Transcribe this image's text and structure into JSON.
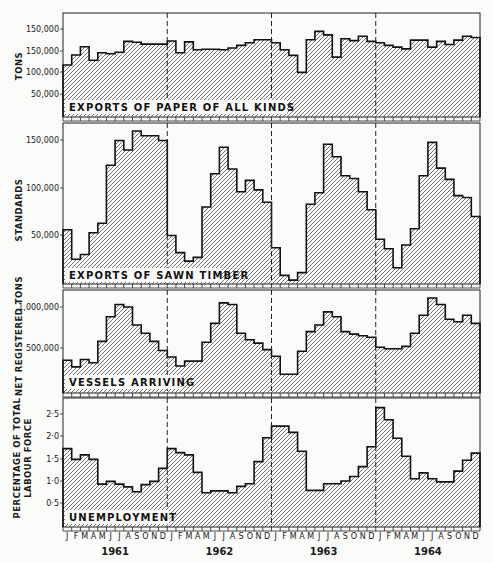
{
  "chart_data": [
    {
      "type": "area",
      "style": "step, hatched fill",
      "title": "EXPORTS OF PAPER OF ALL KINDS",
      "ylabel": "TONS",
      "yticks": [
        "150,000",
        "150,000",
        "100,000",
        "50,000"
      ],
      "ytick_values": [
        200000,
        150000,
        100000,
        50000
      ],
      "ylim": [
        0,
        220000
      ],
      "x_period": "monthly, Jan 1961 - Dec 1964",
      "values": [
        117000,
        140000,
        159000,
        128000,
        145000,
        143000,
        146000,
        171000,
        169000,
        165000,
        165000,
        165000,
        172000,
        145000,
        170000,
        152000,
        153000,
        153000,
        152000,
        156000,
        162000,
        168000,
        175000,
        175000,
        168000,
        152000,
        139000,
        100000,
        175000,
        194000,
        186000,
        135000,
        177000,
        173000,
        183000,
        171000,
        168000,
        162000,
        158000,
        154000,
        174000,
        174000,
        158000,
        171000,
        164000,
        174000,
        183000,
        180000
      ]
    },
    {
      "type": "area",
      "style": "step, hatched fill",
      "title": "EXPORTS OF SAWN TIMBER",
      "ylabel": "STANDARDS",
      "yticks": [
        "150,000",
        "100,000",
        "50,000"
      ],
      "ytick_values": [
        150000,
        100000,
        50000
      ],
      "ylim": [
        0,
        170000
      ],
      "x_period": "monthly, Jan 1961 - Dec 1964",
      "values": [
        56000,
        25000,
        30000,
        53000,
        63000,
        124000,
        150000,
        140000,
        160000,
        155000,
        155000,
        150000,
        50000,
        32000,
        23000,
        27000,
        80000,
        115000,
        143000,
        120000,
        96000,
        108000,
        98000,
        85000,
        37000,
        8000,
        3000,
        11000,
        83000,
        95000,
        146000,
        133000,
        113000,
        110000,
        96000,
        77000,
        46000,
        36000,
        16000,
        40000,
        57000,
        113000,
        148000,
        121000,
        109000,
        92000,
        90000,
        70000
      ]
    },
    {
      "type": "area",
      "style": "step, hatched fill",
      "title": "VESSELS ARRIVING",
      "ylabel": "NET REGISTERED TONS",
      "yticks": [
        "1,000,000",
        "500,000"
      ],
      "ytick_values": [
        1000000,
        500000
      ],
      "ylim": [
        0,
        1200000
      ],
      "x_period": "monthly, Jan 1961 - Dec 1964",
      "values": [
        350000,
        270000,
        360000,
        320000,
        580000,
        880000,
        1030000,
        1000000,
        780000,
        680000,
        580000,
        470000,
        390000,
        280000,
        340000,
        340000,
        570000,
        800000,
        1050000,
        1030000,
        680000,
        600000,
        560000,
        480000,
        400000,
        180000,
        180000,
        460000,
        700000,
        780000,
        940000,
        880000,
        700000,
        670000,
        650000,
        630000,
        510000,
        490000,
        490000,
        520000,
        680000,
        900000,
        1110000,
        1030000,
        850000,
        820000,
        900000,
        800000
      ]
    },
    {
      "type": "area",
      "style": "step, hatched fill",
      "title": "UNEMPLOYMENT",
      "ylabel": "PERCENTAGE OF TOTAL LABOUR FORCE",
      "yticks": [
        "2·5",
        "2·0",
        "1·5",
        "1·0",
        "0·5"
      ],
      "ytick_values": [
        2.5,
        2.0,
        1.5,
        1.0,
        0.5
      ],
      "ylim": [
        0,
        2.85
      ],
      "x_period": "monthly, Jan 1961 - Dec 1964",
      "values": [
        1.72,
        1.48,
        1.58,
        1.48,
        0.93,
        0.99,
        0.93,
        0.87,
        0.76,
        0.92,
        0.99,
        1.28,
        1.72,
        1.63,
        1.58,
        1.19,
        0.74,
        0.78,
        0.78,
        0.74,
        0.88,
        0.94,
        1.43,
        1.96,
        2.22,
        2.22,
        2.08,
        1.66,
        0.79,
        0.79,
        0.94,
        0.94,
        1.0,
        1.1,
        1.32,
        1.76,
        2.63,
        2.36,
        1.95,
        1.55,
        1.05,
        1.18,
        1.05,
        0.98,
        0.98,
        1.22,
        1.46,
        1.62
      ]
    }
  ],
  "x_axis": {
    "month_labels": [
      "J",
      "F",
      "M",
      "A",
      "M",
      "J",
      "J",
      "A",
      "S",
      "O",
      "N",
      "D"
    ],
    "years": [
      "1961",
      "1962",
      "1963",
      "1964"
    ]
  },
  "panels": {
    "paper": {
      "title": "EXPORTS OF PAPER OF ALL KINDS",
      "ylabel": "TONS"
    },
    "timber": {
      "title": "EXPORTS OF SAWN TIMBER",
      "ylabel": "STANDARDS"
    },
    "vessels": {
      "title": "VESSELS ARRIVING",
      "ylabel": "NET REGISTERED TONS"
    },
    "unemployment": {
      "title": "UNEMPLOYMENT",
      "ylabel_line1": "PERCENTAGE OF TOTAL",
      "ylabel_line2": "LABOUR FORCE"
    }
  },
  "colors": {
    "ink": "#1a1a1a",
    "paper": "#fbfbf9",
    "hatch": "#333333"
  }
}
